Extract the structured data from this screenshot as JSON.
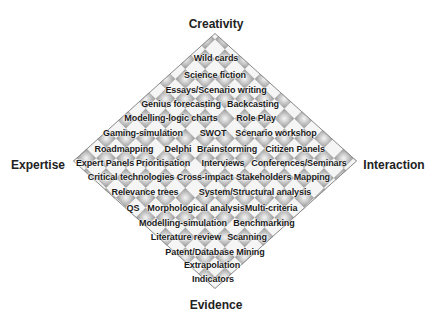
{
  "axes": {
    "top": "Creativity",
    "bottom": "Evidence",
    "left": "Expertise",
    "right": "Interaction"
  },
  "colors": {
    "pattern_dark": "#9a9a9a",
    "pattern_light": "#f2f2f2",
    "text": "#1a1a1a",
    "border": "#8a8a8a"
  },
  "methods": [
    {
      "label": "Wild cards",
      "x": 216,
      "y": 58
    },
    {
      "label": "Science fiction",
      "x": 215,
      "y": 75
    },
    {
      "label": "Essays/Scenario writing",
      "x": 216,
      "y": 90
    },
    {
      "label": "Genius forecasting",
      "x": 181,
      "y": 104
    },
    {
      "label": "Backcasting",
      "x": 253,
      "y": 104
    },
    {
      "label": "Modelling-logic charts",
      "x": 171,
      "y": 118
    },
    {
      "label": "Role Play",
      "x": 256,
      "y": 118
    },
    {
      "label": "Gaming-simulation",
      "x": 143,
      "y": 133
    },
    {
      "label": "SWOT",
      "x": 213,
      "y": 133
    },
    {
      "label": "Scenario workshop",
      "x": 276,
      "y": 133
    },
    {
      "label": "Roadmapping",
      "x": 124,
      "y": 149
    },
    {
      "label": "Delphi",
      "x": 178,
      "y": 149
    },
    {
      "label": "Brainstorming",
      "x": 227,
      "y": 149
    },
    {
      "label": "Citizen Panels",
      "x": 295,
      "y": 149
    },
    {
      "label": "Expert Panels",
      "x": 105,
      "y": 163
    },
    {
      "label": "Prioritisation",
      "x": 163,
      "y": 163
    },
    {
      "label": "Interviews",
      "x": 223,
      "y": 163
    },
    {
      "label": "Conferences/Seminars",
      "x": 299,
      "y": 163
    },
    {
      "label": "Critical technologies",
      "x": 131,
      "y": 177
    },
    {
      "label": "Cross-impact",
      "x": 205,
      "y": 177
    },
    {
      "label": "Stakeholders Mapping",
      "x": 283,
      "y": 177
    },
    {
      "label": "Relevance trees",
      "x": 145,
      "y": 192
    },
    {
      "label": "System/Structural analysis",
      "x": 255,
      "y": 192
    },
    {
      "label": "QS",
      "x": 133,
      "y": 208
    },
    {
      "label": "Morphological analysis",
      "x": 196,
      "y": 208
    },
    {
      "label": "Multi-criteria",
      "x": 271,
      "y": 208
    },
    {
      "label": "Modelling-simulation",
      "x": 183,
      "y": 223
    },
    {
      "label": "Benchmarking",
      "x": 264,
      "y": 223
    },
    {
      "label": "Literature review",
      "x": 186,
      "y": 237
    },
    {
      "label": "Scanning",
      "x": 247,
      "y": 237
    },
    {
      "label": "Patent/Database Mining",
      "x": 215,
      "y": 252
    },
    {
      "label": "Extrapolation",
      "x": 212,
      "y": 265
    },
    {
      "label": "Indicators",
      "x": 213,
      "y": 279
    }
  ]
}
